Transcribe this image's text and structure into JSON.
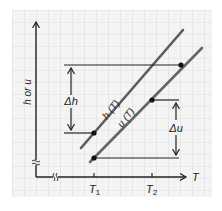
{
  "diagram": {
    "type": "thermodynamics-property-diagram",
    "colors": {
      "background": "#ffffff",
      "grid_fill": "#f4f4f4",
      "grid_line": "#dcdcdc",
      "axis": "#222222",
      "curve_h": "#5a5a5a",
      "curve_u": "#6a6a6a",
      "marker": "#111111"
    },
    "axes": {
      "y_label": "h or u",
      "x_label": "T",
      "x_ticks": [
        {
          "label_main": "T",
          "label_sub": "1"
        },
        {
          "label_main": "T",
          "label_sub": "2"
        }
      ],
      "y_axis_break": true,
      "x_axis_break": true
    },
    "curves": [
      {
        "name": "h",
        "label": "h (T)"
      },
      {
        "name": "u",
        "label": "u (T)"
      }
    ],
    "annotations": {
      "delta_h": "Δh",
      "delta_u": "Δu"
    }
  }
}
